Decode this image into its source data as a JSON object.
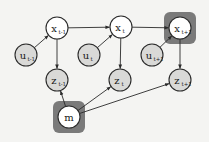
{
  "diagram": {
    "type": "graphical-model",
    "colors": {
      "background": "#f4f4f2",
      "observed_fill": "#d9d9d7",
      "latent_fill": "#ffffff",
      "highlight": "#7a7a7a",
      "stroke": "#2a2a2a"
    },
    "nodes": [
      {
        "id": "x_prev",
        "base": "x",
        "sub": "t-1",
        "cx": 57,
        "cy": 28,
        "observed": false,
        "highlighted": false
      },
      {
        "id": "x_curr",
        "base": "x",
        "sub": "t",
        "cx": 121,
        "cy": 27,
        "observed": false,
        "highlighted": false
      },
      {
        "id": "x_next",
        "base": "x",
        "sub": "t+1",
        "cx": 180,
        "cy": 28,
        "observed": false,
        "highlighted": true
      },
      {
        "id": "u_prev",
        "base": "u",
        "sub": "t-1",
        "cx": 26,
        "cy": 55,
        "observed": true,
        "highlighted": false
      },
      {
        "id": "u_curr",
        "base": "u",
        "sub": "t",
        "cx": 89,
        "cy": 55,
        "observed": true,
        "highlighted": false
      },
      {
        "id": "u_next",
        "base": "u",
        "sub": "t+1",
        "cx": 152,
        "cy": 55,
        "observed": true,
        "highlighted": false
      },
      {
        "id": "z_prev",
        "base": "z",
        "sub": "t-1",
        "cx": 57,
        "cy": 80,
        "observed": true,
        "highlighted": false
      },
      {
        "id": "z_curr",
        "base": "z",
        "sub": "t",
        "cx": 120,
        "cy": 80,
        "observed": true,
        "highlighted": false
      },
      {
        "id": "z_next",
        "base": "z",
        "sub": "t+1",
        "cx": 180,
        "cy": 80,
        "observed": true,
        "highlighted": false
      },
      {
        "id": "m",
        "base": "m",
        "sub": "",
        "cx": 69,
        "cy": 117,
        "observed": false,
        "highlighted": true
      }
    ],
    "edges": [
      {
        "from": "x_prev",
        "to": "x_curr"
      },
      {
        "from": "x_curr",
        "to": "x_next"
      },
      {
        "from": "u_prev",
        "to": "x_prev"
      },
      {
        "from": "u_curr",
        "to": "x_curr"
      },
      {
        "from": "u_next",
        "to": "x_next"
      },
      {
        "from": "x_prev",
        "to": "z_prev"
      },
      {
        "from": "x_curr",
        "to": "z_curr"
      },
      {
        "from": "x_next",
        "to": "z_next"
      },
      {
        "from": "m",
        "to": "z_prev"
      },
      {
        "from": "m",
        "to": "z_curr"
      },
      {
        "from": "m",
        "to": "z_next"
      }
    ]
  }
}
